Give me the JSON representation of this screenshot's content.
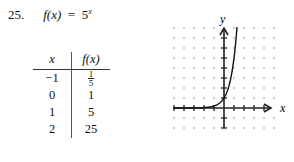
{
  "problem": {
    "number": "25.",
    "lhs": "f(x)",
    "equals": "=",
    "base": "5",
    "exponent": "x"
  },
  "table": {
    "headers": [
      "x",
      "f(x)"
    ],
    "rows": [
      {
        "x": "−1",
        "fx_num": "1",
        "fx_den": "5",
        "fx": "1/5"
      },
      {
        "x": "0",
        "fx": "1"
      },
      {
        "x": "1",
        "fx": "5"
      },
      {
        "x": "2",
        "fx": "25"
      }
    ]
  },
  "graph": {
    "x_label": "x",
    "y_label": "y",
    "grid_unit_px": 10,
    "origin_px": [
      224,
      108
    ],
    "x_range": [
      -5,
      5
    ],
    "y_range": [
      -2,
      8
    ],
    "curve": "y = 5^x"
  }
}
